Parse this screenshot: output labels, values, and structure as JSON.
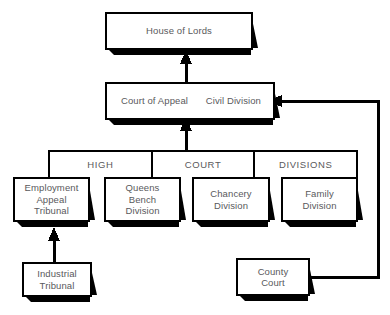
{
  "diagram": {
    "background_color": "#ffffff",
    "line_color": "#000000",
    "text_color": "#59595c"
  },
  "nodes": {
    "house_of_lords": {
      "label": "House of Lords"
    },
    "court_of_appeal": {
      "label": "Court of Appeal",
      "division": "Civil Division",
      "division_line1": "Civil",
      "division_line2": "Division"
    },
    "employment_appeal_tribunal": {
      "line1": "Employment",
      "line2": "Appeal",
      "line3": "Tribunal"
    },
    "queens_bench_division": {
      "line1": "Queens",
      "line2": "Bench",
      "line3": "Division"
    },
    "chancery_division": {
      "line1": "Chancery",
      "line2": "Division"
    },
    "family_division": {
      "line1": "Family",
      "line2": "Division"
    },
    "industrial_tribunal": {
      "line1": "Industrial",
      "line2": "Tribunal"
    },
    "county_court": {
      "line1": "County",
      "line2": "Court"
    }
  },
  "band": {
    "cells": [
      {
        "label": "HIGH"
      },
      {
        "label": "COURT"
      },
      {
        "label": "DIVISIONS"
      }
    ]
  }
}
